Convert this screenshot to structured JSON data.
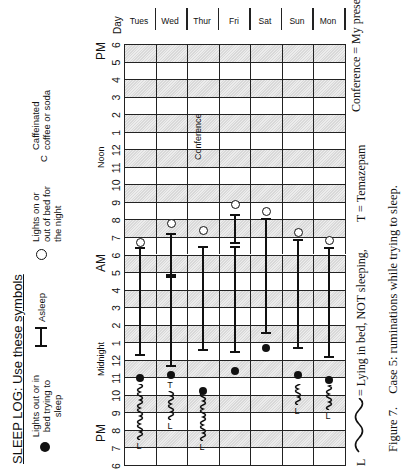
{
  "title": "SLEEP LOG:  Use these symbols",
  "legend": {
    "lights_out": "Lights out or in bed trying to sleep",
    "asleep": "Asleep",
    "lights_on": "Lights on or out of bed for the night",
    "caffeine_symbol": "C",
    "caffeine": "Caffeinated coffee or soda"
  },
  "axis": {
    "pm_left": "PM",
    "midnight": "Midnight",
    "am": "AM",
    "noon": "Noon",
    "pm_right": "PM",
    "ticks": [
      "6",
      "7",
      "8",
      "9",
      "10",
      "11",
      "12",
      "1",
      "2",
      "3",
      "4",
      "5",
      "6",
      "7",
      "8",
      "9",
      "10",
      "11",
      "12",
      "1",
      "2",
      "3",
      "4",
      "5",
      "6"
    ],
    "day_header": "Day"
  },
  "days": [
    "Tues",
    "Wed",
    "Thur",
    "Fri",
    "Sat",
    "Sun",
    "Mon"
  ],
  "annotations": {
    "conference_cell": "Conference",
    "conference_note": "Conference = My presentation",
    "lying_symbol": "L",
    "lying_note": "= Lying in bed, NOT sleeping,",
    "temazepam_note": "T  =  Temazepam",
    "temazepam_symbol": "T"
  },
  "caption": {
    "label": "Figure 7.",
    "text": "Case 5: ruminations while trying to sleep."
  },
  "chart_data": {
    "type": "table",
    "title": "SLEEP LOG",
    "xlabel": "Time (6 PM to 6 PM)",
    "ylabel": "Day",
    "hours_from_6pm_note": "values are hours after 6 PM",
    "rows": [
      {
        "day": "Tues",
        "lights_out": 5.0,
        "lying": [
          1.5,
          4.7
        ],
        "sleep": [
          [
            6.3,
            12.4
          ]
        ],
        "lights_on": 12.7
      },
      {
        "day": "Wed",
        "lights_out": 5.2,
        "temazepam": 4.6,
        "lying": [
          2.6,
          4.3
        ],
        "sleep": [
          [
            5.7,
            10.8
          ],
          [
            10.9,
            13.2
          ]
        ],
        "lights_on": 13.8
      },
      {
        "day": "Thur",
        "lights_out": 4.3,
        "lying": [
          1.4,
          4.1
        ],
        "sleep": [
          [
            6.6,
            12.5
          ]
        ],
        "lights_on": 13.4,
        "note": "Conference (~17.5-20.5)"
      },
      {
        "day": "Fri",
        "lights_out": 5.4,
        "sleep": [
          [
            6.5,
            12.5
          ],
          [
            12.7,
            14.3
          ]
        ],
        "lights_on": 14.9
      },
      {
        "day": "Sat",
        "lights_out": 6.7,
        "sleep": [
          [
            7.6,
            14.1
          ]
        ],
        "lights_on": 14.5
      },
      {
        "day": "Sun",
        "lights_out": 5.2,
        "lying": [
          3.5,
          4.7
        ],
        "sleep": [
          [
            6.7,
            12.9
          ]
        ],
        "lights_on": 13.3
      },
      {
        "day": "Mon",
        "lights_out": 4.9,
        "lying": [
          3.2,
          4.6
        ],
        "sleep": [
          [
            6.2,
            12.4
          ]
        ],
        "lights_on": 12.8
      }
    ]
  }
}
